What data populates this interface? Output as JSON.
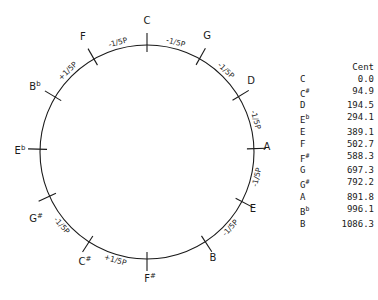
{
  "circle": {
    "cx": 147,
    "cy": 152,
    "r": 107,
    "notes": [
      {
        "name": "C",
        "acc": "",
        "angle": 0,
        "lx": 147,
        "ly": 24
      },
      {
        "name": "G",
        "acc": "",
        "angle": 29.4,
        "lx": 207,
        "ly": 39
      },
      {
        "name": "D",
        "acc": "",
        "angle": 58.8,
        "lx": 251,
        "ly": 84
      },
      {
        "name": "A",
        "acc": "",
        "angle": 88.2,
        "lx": 267,
        "ly": 150
      },
      {
        "name": "E",
        "acc": "",
        "angle": 117.6,
        "lx": 253,
        "ly": 212
      },
      {
        "name": "B",
        "acc": "",
        "angle": 147.0,
        "lx": 213,
        "ly": 261
      },
      {
        "name": "F",
        "acc": "#",
        "angle": 180,
        "lx": 150,
        "ly": 282
      },
      {
        "name": "C",
        "acc": "#",
        "angle": 212.8,
        "lx": 85,
        "ly": 265
      },
      {
        "name": "G",
        "acc": "#",
        "angle": 245.6,
        "lx": 36,
        "ly": 222
      },
      {
        "name": "E",
        "acc": "b",
        "angle": 271.5,
        "lx": 20,
        "ly": 154
      },
      {
        "name": "B",
        "acc": "b",
        "angle": 300.9,
        "lx": 35,
        "ly": 90
      },
      {
        "name": "F",
        "acc": "",
        "angle": 330.3,
        "lx": 83,
        "ly": 40
      }
    ],
    "arc_labels": [
      {
        "text": "-1/5P",
        "angle": 14.7
      },
      {
        "text": "-1/5P",
        "angle": 44.1
      },
      {
        "text": "-1/5P",
        "angle": 73.5
      },
      {
        "text": "-1/5P",
        "angle": 102.9
      },
      {
        "text": "-1/5P",
        "angle": 132.3
      },
      {
        "text": "+1/5P",
        "angle": 196.4
      },
      {
        "text": "-1/5P",
        "angle": 229.2
      },
      {
        "text": "+1/5P",
        "angle": 315.6
      },
      {
        "text": "-1/5P",
        "angle": 345.1
      }
    ]
  },
  "table": {
    "header": "Cent",
    "rows": [
      {
        "note": "C",
        "acc": "",
        "cents": "0.0"
      },
      {
        "note": "C",
        "acc": "#",
        "cents": "94.9"
      },
      {
        "note": "D",
        "acc": "",
        "cents": "194.5"
      },
      {
        "note": "E",
        "acc": "b",
        "cents": "294.1"
      },
      {
        "note": "E",
        "acc": "",
        "cents": "389.1"
      },
      {
        "note": "F",
        "acc": "",
        "cents": "502.7"
      },
      {
        "note": "F",
        "acc": "#",
        "cents": "588.3"
      },
      {
        "note": "G",
        "acc": "",
        "cents": "697.3"
      },
      {
        "note": "G",
        "acc": "#",
        "cents": "792.2"
      },
      {
        "note": "A",
        "acc": "",
        "cents": "891.8"
      },
      {
        "note": "B",
        "acc": "b",
        "cents": "996.1"
      },
      {
        "note": "B",
        "acc": "",
        "cents": "1086.3"
      }
    ]
  }
}
